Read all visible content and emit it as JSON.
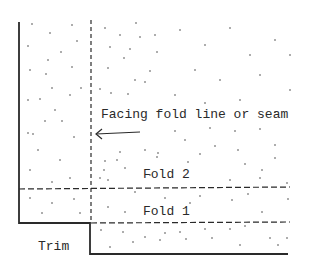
{
  "diagram": {
    "labels": {
      "facing": "Facing fold line or seam",
      "fold2": "Fold 2",
      "fold1": "Fold 1",
      "trim": "Trim"
    },
    "colors": {
      "ink": "#2a2a2a",
      "background": "#ffffff"
    }
  }
}
